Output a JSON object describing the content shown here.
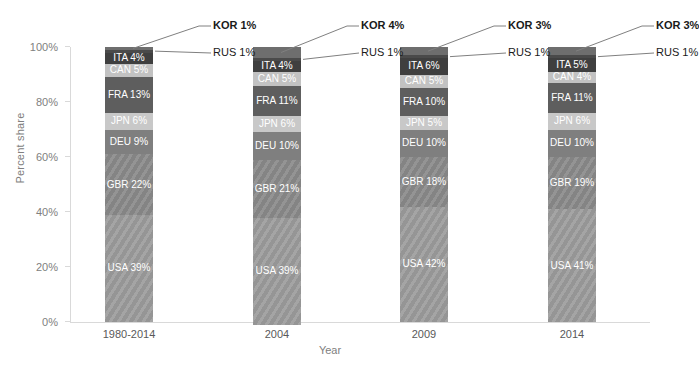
{
  "chart_data": {
    "type": "bar",
    "subtype": "stacked-100-percent",
    "title": "",
    "xlabel": "Year",
    "ylabel": "Percent share",
    "categories": [
      "1980-2014",
      "2004",
      "2009",
      "2014"
    ],
    "ylim": [
      0,
      100
    ],
    "ytick_labels": [
      "0%",
      "20%",
      "40%",
      "60%",
      "80%",
      "100%"
    ],
    "ytick_values": [
      0,
      20,
      40,
      60,
      80,
      100
    ],
    "grid": false,
    "legend": "none (series labelled in-place)",
    "stack_order_bottom_to_top": [
      "USA",
      "GBR",
      "DEU",
      "JPN",
      "FRA",
      "CAN",
      "ITA",
      "RUS",
      "KOR"
    ],
    "series": [
      {
        "name": "USA",
        "values": [
          39,
          39,
          42,
          41
        ],
        "color": "#9c9c9c",
        "textured": true
      },
      {
        "name": "GBR",
        "values": [
          22,
          21,
          18,
          19
        ],
        "color": "#8a8a8a",
        "textured": true
      },
      {
        "name": "DEU",
        "values": [
          9,
          10,
          10,
          10
        ],
        "color": "#7f7f7f",
        "textured": false
      },
      {
        "name": "JPN",
        "values": [
          6,
          6,
          5,
          6
        ],
        "color": "#c8c8c8",
        "textured": false
      },
      {
        "name": "FRA",
        "values": [
          13,
          11,
          10,
          11
        ],
        "color": "#5e5e5e",
        "textured": false
      },
      {
        "name": "CAN",
        "values": [
          5,
          5,
          5,
          4
        ],
        "color": "#c2c2c2",
        "textured": false
      },
      {
        "name": "ITA",
        "values": [
          4,
          4,
          6,
          5
        ],
        "color": "#3f3f3f",
        "textured": false
      },
      {
        "name": "RUS",
        "values": [
          1,
          1,
          1,
          1
        ],
        "color": "#4a4a4a",
        "textured": false
      },
      {
        "name": "KOR",
        "values": [
          1,
          4,
          3,
          3
        ],
        "color": "#6e6e6e",
        "textured": false
      }
    ]
  },
  "bars": [
    {
      "category": "1980-2014",
      "segments": [
        {
          "label": "ITA 4%",
          "name": "ITA",
          "value": 4,
          "color": "#3f3f3f",
          "textured": false,
          "show_label": true
        },
        {
          "label": "CAN 5%",
          "name": "CAN",
          "value": 5,
          "color": "#c2c2c2",
          "textured": false,
          "show_label": true
        },
        {
          "label": "FRA 13%",
          "name": "FRA",
          "value": 13,
          "color": "#5e5e5e",
          "textured": false,
          "show_label": true
        },
        {
          "label": "JPN 6%",
          "name": "JPN",
          "value": 6,
          "color": "#c8c8c8",
          "textured": false,
          "show_label": true
        },
        {
          "label": "DEU 9%",
          "name": "DEU",
          "value": 9,
          "color": "#7f7f7f",
          "textured": false,
          "show_label": true
        },
        {
          "label": "GBR 22%",
          "name": "GBR",
          "value": 22,
          "color": "#8a8a8a",
          "textured": true,
          "show_label": true
        },
        {
          "label": "USA 39%",
          "name": "USA",
          "value": 39,
          "color": "#9c9c9c",
          "textured": true,
          "show_label": true
        }
      ],
      "top_segments": [
        {
          "label": "KOR 1%",
          "name": "KOR",
          "value": 1,
          "color": "#6e6e6e"
        },
        {
          "label": "RUS 1%",
          "name": "RUS",
          "value": 1,
          "color": "#4a4a4a"
        }
      ],
      "callouts": {
        "kor": "KOR 1%",
        "rus": "RUS 1%"
      }
    },
    {
      "category": "2004",
      "segments": [
        {
          "label": "ITA 4%",
          "name": "ITA",
          "value": 4,
          "color": "#3f3f3f",
          "textured": false,
          "show_label": true
        },
        {
          "label": "CAN 5%",
          "name": "CAN",
          "value": 5,
          "color": "#c2c2c2",
          "textured": false,
          "show_label": true
        },
        {
          "label": "FRA 11%",
          "name": "FRA",
          "value": 11,
          "color": "#5e5e5e",
          "textured": false,
          "show_label": true
        },
        {
          "label": "JPN 6%",
          "name": "JPN",
          "value": 6,
          "color": "#c8c8c8",
          "textured": false,
          "show_label": true
        },
        {
          "label": "DEU 10%",
          "name": "DEU",
          "value": 10,
          "color": "#7f7f7f",
          "textured": false,
          "show_label": true
        },
        {
          "label": "GBR 21%",
          "name": "GBR",
          "value": 21,
          "color": "#8a8a8a",
          "textured": true,
          "show_label": true
        },
        {
          "label": "USA 39%",
          "name": "USA",
          "value": 39,
          "color": "#9c9c9c",
          "textured": true,
          "show_label": true
        }
      ],
      "top_segments": [
        {
          "label": "KOR 4%",
          "name": "KOR",
          "value": 4,
          "color": "#6e6e6e"
        },
        {
          "label": "RUS 1%",
          "name": "RUS",
          "value": 1,
          "color": "#4a4a4a"
        }
      ],
      "callouts": {
        "kor": "KOR 4%",
        "rus": "RUS 1%"
      }
    },
    {
      "category": "2009",
      "segments": [
        {
          "label": "ITA 6%",
          "name": "ITA",
          "value": 6,
          "color": "#3f3f3f",
          "textured": false,
          "show_label": true
        },
        {
          "label": "CAN 5%",
          "name": "CAN",
          "value": 5,
          "color": "#c2c2c2",
          "textured": false,
          "show_label": true
        },
        {
          "label": "FRA 10%",
          "name": "FRA",
          "value": 10,
          "color": "#5e5e5e",
          "textured": false,
          "show_label": true
        },
        {
          "label": "JPN 5%",
          "name": "JPN",
          "value": 5,
          "color": "#c8c8c8",
          "textured": false,
          "show_label": true
        },
        {
          "label": "DEU 10%",
          "name": "DEU",
          "value": 10,
          "color": "#7f7f7f",
          "textured": false,
          "show_label": true
        },
        {
          "label": "GBR 18%",
          "name": "GBR",
          "value": 18,
          "color": "#8a8a8a",
          "textured": true,
          "show_label": true
        },
        {
          "label": "USA 42%",
          "name": "USA",
          "value": 42,
          "color": "#9c9c9c",
          "textured": true,
          "show_label": true
        }
      ],
      "top_segments": [
        {
          "label": "KOR 3%",
          "name": "KOR",
          "value": 3,
          "color": "#6e6e6e"
        },
        {
          "label": "RUS 1%",
          "name": "RUS",
          "value": 1,
          "color": "#4a4a4a"
        }
      ],
      "callouts": {
        "kor": "KOR 3%",
        "rus": "RUS 1%"
      }
    },
    {
      "category": "2014",
      "segments": [
        {
          "label": "ITA 5%",
          "name": "ITA",
          "value": 5,
          "color": "#3f3f3f",
          "textured": false,
          "show_label": true
        },
        {
          "label": "CAN 4%",
          "name": "CAN",
          "value": 4,
          "color": "#c2c2c2",
          "textured": false,
          "show_label": true
        },
        {
          "label": "FRA 11%",
          "name": "FRA",
          "value": 11,
          "color": "#5e5e5e",
          "textured": false,
          "show_label": true
        },
        {
          "label": "JPN 6%",
          "name": "JPN",
          "value": 6,
          "color": "#c8c8c8",
          "textured": false,
          "show_label": true
        },
        {
          "label": "DEU 10%",
          "name": "DEU",
          "value": 10,
          "color": "#7f7f7f",
          "textured": false,
          "show_label": true
        },
        {
          "label": "GBR 19%",
          "name": "GBR",
          "value": 19,
          "color": "#8a8a8a",
          "textured": true,
          "show_label": true
        },
        {
          "label": "USA 41%",
          "name": "USA",
          "value": 41,
          "color": "#9c9c9c",
          "textured": true,
          "show_label": true
        }
      ],
      "top_segments": [
        {
          "label": "KOR 3%",
          "name": "KOR",
          "value": 3,
          "color": "#6e6e6e"
        },
        {
          "label": "RUS 1%",
          "name": "RUS",
          "value": 1,
          "color": "#4a4a4a"
        }
      ],
      "callouts": {
        "kor": "KOR 3%",
        "rus": "RUS 1%"
      }
    }
  ],
  "axes": {
    "y_title": "Percent share",
    "x_title": "Year",
    "y_ticks": [
      "100%",
      "80%",
      "60%",
      "40%",
      "20%",
      "0%"
    ],
    "x_ticks": [
      "1980-2014",
      "2004",
      "2009",
      "2014"
    ]
  },
  "colors": {
    "axis": "#d9d9d9",
    "tick_text": "#808080",
    "category_text": "#595959",
    "callout_text": "#1a1a1a",
    "leader_line": "#808080",
    "segment_text": "#ffffff",
    "background": "#ffffff"
  }
}
